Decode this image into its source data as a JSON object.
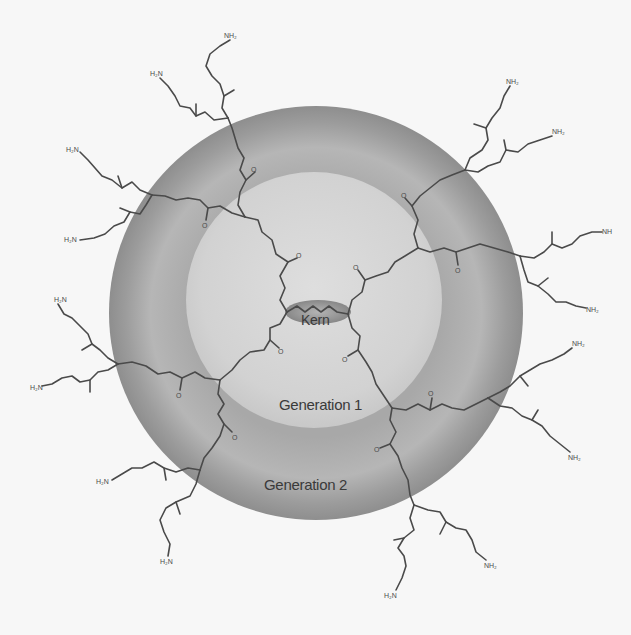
{
  "diagram": {
    "type": "dendrimer-schematic",
    "labels": {
      "core": "Kern",
      "generation1": "Generation 1",
      "generation2": "Generation 2"
    },
    "terminal_group": "NH2",
    "repeat_atoms": {
      "nitrogen": "N",
      "amide_nh": "NH",
      "carbonyl_o": "O",
      "amine": "H2N"
    },
    "colors": {
      "background": "#f7f7f7",
      "generation2_ring": "#9a9a9a",
      "generation2_ring_highlight": "#b4b4b4",
      "generation1_disk": "#d4d4d4",
      "core_ellipse": "#8a8a8a",
      "bonds": "#4a4a4a",
      "label_text": "#3a3a3a"
    },
    "geometry": {
      "center": [
        316,
        313
      ],
      "generation2_outer_radius": 207,
      "generation1_radius": 128
    },
    "branch_count": {
      "core_arms": 4,
      "generation1_branches": 8,
      "terminal_amines": 16
    }
  }
}
